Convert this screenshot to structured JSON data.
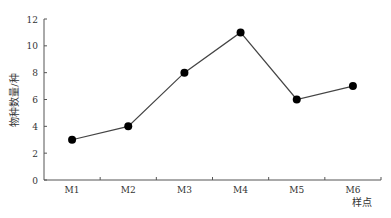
{
  "chart_data": {
    "type": "line",
    "title": "",
    "xlabel": "样点",
    "ylabel": "物种数量/种",
    "categories": [
      "M1",
      "M2",
      "M3",
      "M4",
      "M5",
      "M6"
    ],
    "values": [
      3,
      4,
      8,
      11,
      6,
      7
    ],
    "ylim": [
      0,
      12
    ],
    "yticks": [
      0,
      2,
      4,
      6,
      8,
      10,
      12
    ],
    "grid": false,
    "legend": null,
    "marker": "filled-circle",
    "line_color": "#444444",
    "marker_color": "#000000"
  }
}
